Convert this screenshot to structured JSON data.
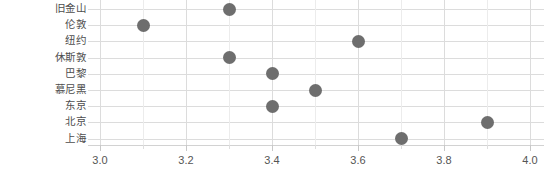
{
  "chart_data": {
    "type": "scatter",
    "title": "",
    "subtitle": "",
    "xlabel": "",
    "ylabel": "",
    "orientation": "horizontal",
    "categories": [
      "旧金山",
      "伦敦",
      "纽约",
      "休斯敦",
      "巴黎",
      "慕尼黑",
      "东京",
      "北京",
      "上海"
    ],
    "values": [
      3.3,
      3.1,
      3.6,
      3.3,
      3.4,
      3.5,
      3.4,
      3.9,
      3.7
    ],
    "points": [
      {
        "category": "旧金山",
        "value": 3.3
      },
      {
        "category": "伦敦",
        "value": 3.1
      },
      {
        "category": "纽约",
        "value": 3.6
      },
      {
        "category": "休斯敦",
        "value": 3.3
      },
      {
        "category": "巴黎",
        "value": 3.4
      },
      {
        "category": "慕尼黑",
        "value": 3.5
      },
      {
        "category": "东京",
        "value": 3.4
      },
      {
        "category": "北京",
        "value": 3.9
      },
      {
        "category": "上海",
        "value": 3.7
      }
    ],
    "xlim": [
      3.0,
      4.0
    ],
    "xticks": [
      3.0,
      3.2,
      3.4,
      3.6,
      3.8,
      4.0
    ],
    "xtick_labels": [
      "3.0",
      "3.2",
      "3.4",
      "3.6",
      "3.8",
      "4.0"
    ],
    "xminor_ticks": [
      3.1,
      3.3,
      3.5,
      3.7,
      3.9
    ],
    "grid": {
      "horizontal": true,
      "vertical": true
    },
    "legend": {
      "show": false,
      "position": "none"
    },
    "marker": {
      "shape": "circle",
      "size": 13,
      "color": "#6e6e6e"
    },
    "colors": {
      "marker": "#6e6e6e",
      "grid": "#dcdcdc",
      "grid_minor": "#ececec",
      "axis": "#d2d2d2",
      "tick_label": "#555555",
      "category_label": "#4d4d4d",
      "background": "#ffffff"
    }
  }
}
